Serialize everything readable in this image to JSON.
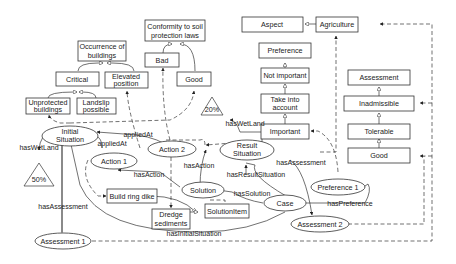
{
  "diagram": {
    "type": "ontology-concept-map",
    "boxes": {
      "conformity": [
        "Conformity to soil",
        "protection laws"
      ],
      "occurrence": [
        "Occurrence of",
        "buildings"
      ],
      "bad": "Bad",
      "good_conf": "Good",
      "critical": "Critical",
      "elevated": [
        "Elevated",
        "position"
      ],
      "unprotected": [
        "Unprotected",
        "buildings"
      ],
      "landslip": [
        "Landslip",
        "possible"
      ],
      "aspect": "Aspect",
      "agriculture": "Agriculture",
      "preference": "Preference",
      "not_important": "Not important",
      "take_into": [
        "Take into",
        "account"
      ],
      "important": "Important",
      "assessment": "Assessment",
      "inadmissible": "Inadmissible",
      "tolerable": "Tolerable",
      "good_assess": "Good",
      "build_ring_dike": "Build ring dike",
      "dredge": [
        "Dredge",
        "sediments"
      ],
      "solution_item": "SolutionItem"
    },
    "ellipses": {
      "initial_situation": [
        "Initial",
        "Situation"
      ],
      "action1": "Action 1",
      "action2": "Action 2",
      "result_situation": [
        "Result",
        "Situation"
      ],
      "solution": "Solution",
      "case": "Case",
      "preference1": "Preference 1",
      "assessment1": "Assessment 1",
      "assessment2": "Assessment 2"
    },
    "triangles": {
      "t50": "50%",
      "t20": "20%"
    },
    "edge_labels": {
      "hasWetLand_left": "hasWetLand",
      "hasWetLand_right": "hasWetLand",
      "appliedAt_1": "appliedAt",
      "appliedAt_2": "appliedAt",
      "hasAction_1": "hasAction",
      "hasAction_2": "hasAction",
      "hasAssessment_1": "hasAssessment",
      "hasAssessment_2": "hasAssessment",
      "hasResultSituation": "hasResultSituation",
      "hasSolution": "hasSolution",
      "hasPreference": "hasPreference",
      "hasInitialSituation": "hasInitialSituation"
    }
  }
}
